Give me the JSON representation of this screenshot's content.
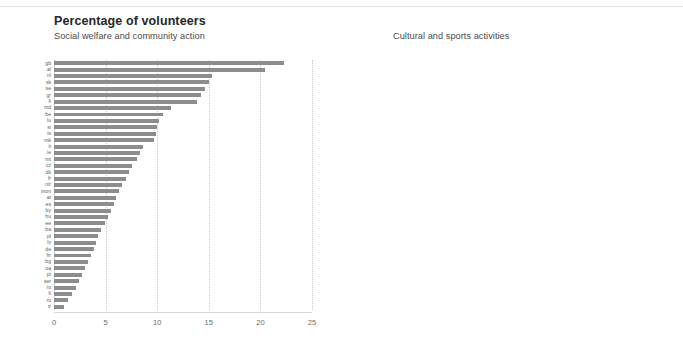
{
  "header": {
    "title": "Percentage of volunteers"
  },
  "chart_data": [
    {
      "type": "bar",
      "orientation": "horizontal",
      "title": "Percentage of volunteers",
      "subtitle": "Social welfare and community action",
      "xlabel": "",
      "ylabel": "",
      "xlim": [
        0,
        25
      ],
      "xticks": [
        "0",
        "5",
        "10",
        "15",
        "20",
        "25"
      ],
      "grid": true,
      "legend": "none",
      "bar_color": "#8d8d8d",
      "categories": [
        "gb",
        "al",
        "nl",
        "sk",
        "se",
        "gr",
        "fi",
        "md",
        "be",
        "lu",
        "si",
        "is",
        "mk",
        "it",
        "ie",
        "mt",
        "cz",
        "dk",
        "fr",
        "nir",
        "mon",
        "at",
        "es",
        "by",
        "hu",
        "ee",
        "ba",
        "pl",
        "lv",
        "de",
        "hr",
        "bg",
        "ua",
        "pt",
        "ser",
        "ro",
        "lt",
        "ru",
        "tr"
      ],
      "values": [
        22.3,
        20.4,
        15.3,
        15.0,
        14.6,
        14.2,
        13.9,
        11.3,
        10.6,
        10.2,
        10.0,
        9.9,
        9.7,
        8.6,
        8.3,
        8.0,
        7.6,
        7.3,
        7.0,
        6.6,
        6.3,
        6.0,
        5.8,
        5.5,
        5.2,
        4.9,
        4.6,
        4.3,
        4.1,
        3.9,
        3.6,
        3.3,
        3.0,
        2.7,
        2.4,
        2.1,
        1.7,
        1.4,
        1.0
      ]
    },
    {
      "type": "bar",
      "orientation": "horizontal",
      "title": "Percentage of volunteers",
      "subtitle": "Cultural and sports activities",
      "xlabel": "",
      "ylabel": "",
      "xlim": [
        0,
        25
      ],
      "xticks": [
        "0",
        "5",
        "10",
        "15",
        "20",
        "25"
      ],
      "grid": true,
      "legend": "none",
      "bar_color": "#8d8d8d",
      "categories": [
        "nl",
        "se",
        "gr",
        "sk",
        "dk",
        "fi",
        "al",
        "is",
        "ie",
        "be",
        "lu",
        "cz",
        "at",
        "mk",
        "si",
        "fr",
        "md",
        "it",
        "lv",
        "de",
        "ba",
        "hr",
        "mt",
        "ee",
        "mon",
        "gb",
        "pt",
        "nir",
        "bg",
        "es",
        "hu",
        "ser",
        "lt",
        "pl",
        "by",
        "ro",
        "ua",
        "ru",
        "tr"
      ],
      "values": [
        24.9,
        22.0,
        15.3,
        15.0,
        14.7,
        13.4,
        13.0,
        12.8,
        12.6,
        12.4,
        12.1,
        11.9,
        11.6,
        11.2,
        10.3,
        9.9,
        9.6,
        9.2,
        8.6,
        8.2,
        7.8,
        7.4,
        7.1,
        6.8,
        6.5,
        6.2,
        5.9,
        5.6,
        5.3,
        5.0,
        4.6,
        4.2,
        3.8,
        3.4,
        3.0,
        2.6,
        2.2,
        1.7,
        1.1
      ]
    }
  ]
}
